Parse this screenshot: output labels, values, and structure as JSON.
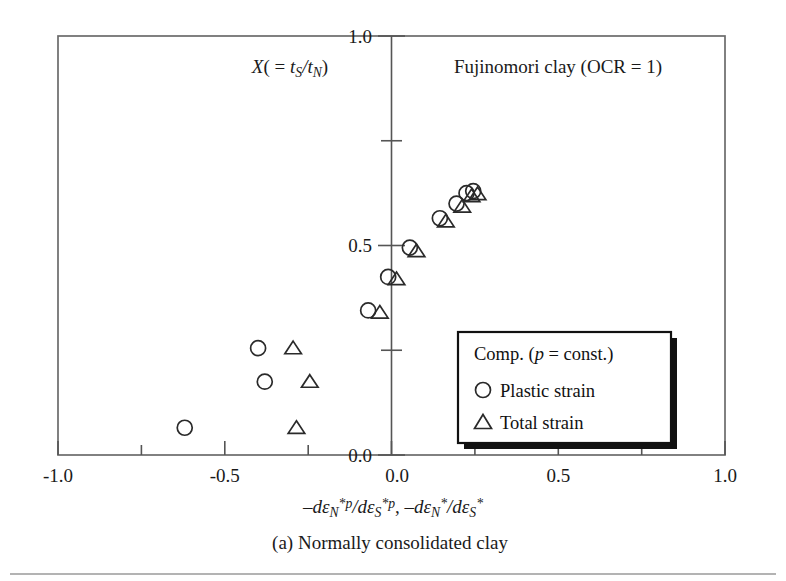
{
  "chart_data": {
    "type": "scatter",
    "title": "Fujinomori clay (OCR = 1)",
    "ylabel_inplot": "X( = tS/tN)",
    "xlabel": "-deN*p/deS*p, -deN*/deS*",
    "caption": "(a) Normally consolidated clay",
    "xlim": [
      -1.0,
      1.0
    ],
    "ylim": [
      0.0,
      1.0
    ],
    "xticks": [
      -1.0,
      -0.75,
      -0.5,
      -0.25,
      0.0,
      0.25,
      0.5,
      0.75,
      1.0
    ],
    "xticklabels": [
      "-1.0",
      "",
      "-0.5",
      "",
      "0.0",
      "",
      "0.5",
      "",
      "1.0"
    ],
    "yticks": [
      0.0,
      0.25,
      0.5,
      0.75,
      1.0
    ],
    "yticklabels": [
      "0.0",
      "",
      "0.5",
      "",
      "1.0"
    ],
    "grid": false,
    "legend_position": "lower-right-inside",
    "series": [
      {
        "name": "Plastic strain",
        "marker": "circle",
        "points": [
          [
            -0.62,
            0.065
          ],
          [
            -0.38,
            0.175
          ],
          [
            -0.4,
            0.255
          ],
          [
            -0.07,
            0.345
          ],
          [
            -0.01,
            0.425
          ],
          [
            0.055,
            0.495
          ],
          [
            0.145,
            0.565
          ],
          [
            0.195,
            0.6
          ],
          [
            0.225,
            0.625
          ],
          [
            0.245,
            0.63
          ]
        ]
      },
      {
        "name": "Total strain",
        "marker": "triangle",
        "points": [
          [
            -0.285,
            0.065
          ],
          [
            -0.245,
            0.175
          ],
          [
            -0.295,
            0.255
          ],
          [
            -0.035,
            0.34
          ],
          [
            0.015,
            0.42
          ],
          [
            0.075,
            0.487
          ],
          [
            0.163,
            0.558
          ],
          [
            0.212,
            0.593
          ],
          [
            0.24,
            0.618
          ],
          [
            0.258,
            0.623
          ]
        ]
      }
    ]
  },
  "axis": {
    "x_tick_labels": [
      {
        "value": -1.0,
        "label": "-1.0"
      },
      {
        "value": -0.5,
        "label": "-0.5"
      },
      {
        "value": 0.0,
        "label": "0.0"
      },
      {
        "value": 0.5,
        "label": "0.5"
      },
      {
        "value": 1.0,
        "label": "1.0"
      }
    ],
    "y_tick_labels": [
      {
        "value": 0.0,
        "label": "0.0"
      },
      {
        "value": 0.5,
        "label": "0.5"
      },
      {
        "value": 1.0,
        "label": "1.0"
      }
    ]
  },
  "labels": {
    "plot_title": "Fujinomori clay (OCR = 1)",
    "y_axis_symbol_X": "X",
    "y_axis_symbol_open": "( = ",
    "y_axis_symbol_t": "t",
    "y_axis_sub_S": "S",
    "y_axis_slash": "/",
    "y_axis_t2": "t",
    "y_axis_sub_N": "N",
    "y_axis_close": ")",
    "caption": "(a) Normally consolidated clay"
  },
  "xlabel_parts": {
    "minus1": "–d",
    "eps1": "ε",
    "sub_N1": "N",
    "sup_p1": "*p",
    "slash1": "/d",
    "eps2": "ε",
    "sub_S1": "S",
    "sup_p2": "*p",
    "comma": ", ",
    "minus2": "–d",
    "eps3": "ε",
    "sub_N2": "N",
    "sup_star1": "*",
    "slash2": "/d",
    "eps4": "ε",
    "sub_S2": "S",
    "sup_star2": "*"
  },
  "legend": {
    "title": "Comp. (p = const.)",
    "title_pre": "Comp. (",
    "title_p": "p",
    "title_post": " = const.)",
    "entries": [
      {
        "marker": "circle",
        "label": "Plastic strain"
      },
      {
        "marker": "triangle",
        "label": "Total strain"
      }
    ]
  },
  "colors": {
    "marker": "#2a2a2a",
    "frame": "#6b6b6b",
    "axis": "#555555",
    "text": "#1a1a1a",
    "legend_border": "#111111",
    "background": "#ffffff"
  }
}
